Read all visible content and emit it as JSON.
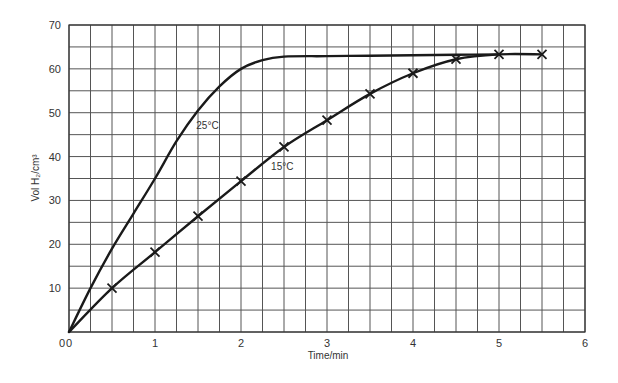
{
  "chart_data": {
    "type": "line",
    "title": "",
    "xlabel": "Time/min",
    "ylabel": "Vol H₂/cm³",
    "xlim": [
      0,
      6
    ],
    "ylim": [
      0,
      70
    ],
    "xticks": [
      0,
      1,
      2,
      3,
      4,
      5,
      6
    ],
    "yticks": [
      0,
      10,
      20,
      30,
      40,
      50,
      60,
      70
    ],
    "grid": true,
    "grid_minor_x": 0.25,
    "grid_minor_y": 5,
    "legend": "none (curves labelled inline)",
    "series": [
      {
        "name": "25°C",
        "markers": false,
        "x": [
          0,
          0.25,
          0.5,
          0.75,
          1.0,
          1.25,
          1.5,
          1.75,
          2.0,
          2.25,
          2.5,
          3.0,
          3.5,
          4.0,
          4.5,
          5.0
        ],
        "y": [
          0,
          10,
          19,
          27,
          35,
          43.5,
          50.5,
          56,
          60,
          62,
          62.8,
          62.9,
          63,
          63.1,
          63.2,
          63.3
        ]
      },
      {
        "name": "15°C",
        "markers": true,
        "marker_symbol": "x",
        "x": [
          0,
          0.5,
          1.0,
          1.5,
          2.0,
          2.5,
          3.0,
          3.5,
          4.0,
          4.5,
          5.0,
          5.5
        ],
        "y": [
          0,
          10,
          18.2,
          26.4,
          34.4,
          42.2,
          48.3,
          54.3,
          59,
          62.2,
          63.3,
          63.3
        ]
      }
    ],
    "annotations": [
      {
        "text": "25°C",
        "x": 1.48,
        "y": 46.2
      },
      {
        "text": "15°C",
        "x": 2.35,
        "y": 37.0
      }
    ]
  }
}
